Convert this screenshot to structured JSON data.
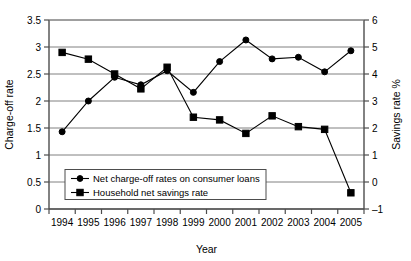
{
  "chart_data": {
    "type": "line",
    "title": "",
    "xlabel": "Year",
    "ylabel": "Charge-off rate",
    "y2label": "Savings rate %",
    "categories": [
      "1994",
      "1995",
      "1996",
      "1997",
      "1998",
      "1999",
      "2000",
      "2001",
      "2002",
      "2003",
      "2004",
      "2005"
    ],
    "ylim": [
      0,
      3.5
    ],
    "ytick_step": 0.5,
    "yticks": [
      "0",
      "0.5",
      "1",
      "1.5",
      "2",
      "2.5",
      "3",
      "3.5"
    ],
    "y2lim": [
      -1,
      6
    ],
    "y2tick_step": 1,
    "y2ticks": [
      "-1",
      "0",
      "1",
      "2",
      "3",
      "4",
      "5",
      "6"
    ],
    "grid": true,
    "legend_position": "lower-left-inside",
    "series": [
      {
        "name": "Net charge-off rates on consumer loans",
        "axis": "left",
        "marker": "circle",
        "color": "#000000",
        "values": [
          1.43,
          2.0,
          2.44,
          2.3,
          2.56,
          2.16,
          2.73,
          3.13,
          2.78,
          2.81,
          2.54,
          2.93
        ]
      },
      {
        "name": "Household net savings rate",
        "axis": "right",
        "marker": "square",
        "color": "#000000",
        "values": [
          4.8,
          4.55,
          4.0,
          3.45,
          4.25,
          2.4,
          2.3,
          1.8,
          2.45,
          2.05,
          1.95,
          -0.4
        ]
      }
    ]
  },
  "legend": {
    "entries": [
      {
        "label": "Net charge-off rates on consumer loans",
        "marker": "circle"
      },
      {
        "label": "Household net savings rate",
        "marker": "square"
      }
    ]
  },
  "icons": {
    "circle_marker": "circle-marker-icon",
    "square_marker": "square-marker-icon"
  }
}
